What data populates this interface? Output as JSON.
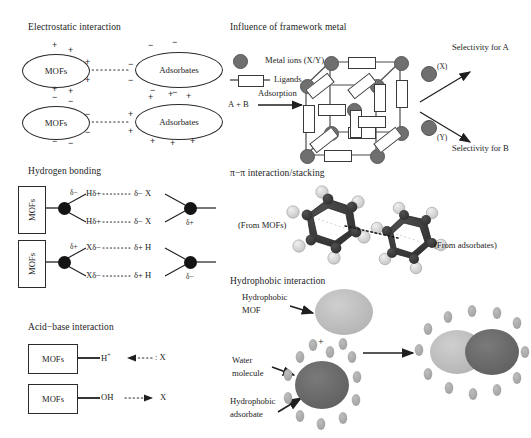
{
  "figure": {
    "caption": "Mechanisms of adsorbate interaction with metal-organic frameworks",
    "width": 531,
    "height": 438
  },
  "colors": {
    "ink": "#1c1c1c",
    "node_dark": "#141414",
    "metal_ion": "#6f6f6f",
    "ligand_fill": "#ffffff",
    "hydrophobic_mof": "#b9b9b9",
    "hydrophobic_adsorbate": "#676767",
    "water_molecule": "#a9a9a9",
    "benzene_ring": "#3a3a3a",
    "hydrogen_atom": "#d8d8d8"
  },
  "panels": {
    "electrostatic": {
      "title": "Electrostatic interaction",
      "rows": [
        {
          "left_label": "MOFs",
          "right_label": "Adsorbates",
          "left_charges": [
            "+",
            "+",
            "+",
            "+",
            "+",
            "+"
          ],
          "right_charges": [
            "−",
            "−",
            "−",
            "−",
            "−",
            "−"
          ],
          "connector": "dotted"
        },
        {
          "left_label": "MOFs",
          "right_label": "Adsorbates",
          "left_charges": [
            "−",
            "−",
            "−",
            "−",
            "−",
            "−"
          ],
          "right_charges": [
            "+",
            "+",
            "+",
            "+",
            "+",
            "+"
          ],
          "connector": "dotted"
        }
      ]
    },
    "hydrogen_bonding": {
      "title": "Hydrogen bonding",
      "rows": [
        {
          "box_label": "MOFs",
          "donor_charge": "δ−",
          "arm_top": "Hδ+",
          "arm_bottom": "Hδ+",
          "acceptor_top": "δ− X",
          "acceptor_bottom": "δ− X",
          "acceptor_charge": "δ+",
          "bond": "⋯⋯"
        },
        {
          "box_label": "MOFs",
          "donor_charge": "δ+",
          "arm_top": "Xδ−",
          "arm_bottom": "Xδ−",
          "acceptor_top": "δ+ H",
          "acceptor_bottom": "δ+ H",
          "acceptor_charge": "δ−",
          "bond": "⋯⋯"
        }
      ]
    },
    "acid_base": {
      "title": "Acid−base interaction",
      "rows": [
        {
          "box_label": "MOFs",
          "group": "H",
          "group_super": "+",
          "arrow_direction": "left",
          "partner": ": X"
        },
        {
          "box_label": "MOFs",
          "group": "OH",
          "group_super": "",
          "arrow_direction": "right",
          "partner": "X"
        }
      ]
    },
    "framework_metal": {
      "title": "Influence of framework metal",
      "legend": [
        {
          "icon": "metal-ion-dot",
          "label": "Metal ions (X/Y)"
        },
        {
          "icon": "ligand-rod",
          "label": "Ligands"
        }
      ],
      "input_label": "A + B",
      "process_label": "Adsorption",
      "outputs": [
        {
          "marker": "(X)",
          "label": "Selectivity for A"
        },
        {
          "marker": "(Y)",
          "label": "Selectivity for B"
        }
      ]
    },
    "pi_stacking": {
      "title": "π−π interaction/stacking",
      "left_label": "(From MOFs)",
      "right_label": "(From adsorbates)",
      "ring_count": 2,
      "connector": "dotted"
    },
    "hydrophobic": {
      "title": "Hydrophobic interaction",
      "labels": {
        "mof": "Hydrophobic\nMOF",
        "mof_line1": "Hydrophobic",
        "mof_line2": "MOF",
        "water_line1": "Water",
        "water_line2": "molecule",
        "adsorbate_line1": "Hydrophobic",
        "adsorbate_line2": "adsorbate"
      },
      "plus_symbol": "+",
      "water_shell_count": 12,
      "product_water_count": 16
    }
  }
}
